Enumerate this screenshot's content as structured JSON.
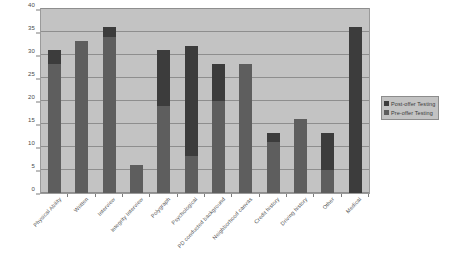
{
  "chart_data": {
    "type": "bar",
    "subtype": "stacked-bar",
    "title": "",
    "xlabel": "",
    "ylabel": "",
    "ylim": [
      0,
      40
    ],
    "ytick_step": 5,
    "yticks": [
      0,
      5,
      10,
      15,
      20,
      25,
      30,
      35,
      40
    ],
    "grid": true,
    "legend_position": "right",
    "categories": [
      "Physical Ability",
      "Written",
      "Interview",
      "Integrity Interview",
      "Polygraph",
      "Psychological",
      "PD conducted background",
      "Neighborhood canvas",
      "Credit history",
      "Driving history",
      "Other",
      "Medical"
    ],
    "series": [
      {
        "name": "Pre-offer Testing",
        "color": "#5e5e5e",
        "values": [
          28,
          33,
          34,
          6,
          19,
          8,
          20,
          28,
          11,
          16,
          5,
          0
        ]
      },
      {
        "name": "Post-offer Testing",
        "color": "#3c3c3c",
        "values": [
          3,
          0,
          2,
          0,
          12,
          24,
          8,
          0,
          2,
          0,
          8,
          36
        ]
      }
    ],
    "totals": [
      31,
      33,
      36,
      6,
      31,
      32,
      28,
      28,
      13,
      16,
      13,
      36
    ]
  },
  "legend": {
    "items": [
      {
        "label": "Post-offer Testing",
        "swatch": "post"
      },
      {
        "label": "Pre-offer Testing",
        "swatch": "pre"
      }
    ]
  },
  "colors": {
    "plot_background": "#c3c3c3",
    "page_background": "#ffffff",
    "gridline": "#8e8e8e",
    "post_offer": "#3c3c3c",
    "pre_offer": "#5e5e5e",
    "axis_text": "#4a4a4a"
  }
}
